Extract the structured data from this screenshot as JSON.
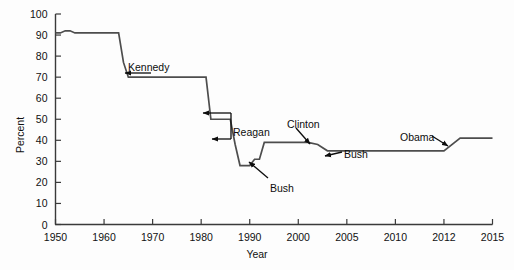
{
  "chart_data": {
    "type": "line",
    "title": "",
    "xlabel": "Year",
    "ylabel": "Percent",
    "ylim": [
      0,
      100
    ],
    "grid": false,
    "legend": "none",
    "y_ticks": [
      0,
      10,
      20,
      30,
      40,
      50,
      60,
      70,
      80,
      90,
      100
    ],
    "x_ticks": [
      1950,
      1960,
      1970,
      1980,
      1990,
      2000,
      2005,
      2010,
      2012,
      2015
    ],
    "x_tick_labels": [
      "1950",
      "1960",
      "1970",
      "1980",
      "1990",
      "2000",
      "2005",
      "2010",
      "2012",
      "2015"
    ],
    "y_tick_labels": [
      "0",
      "10",
      "20",
      "30",
      "40",
      "50",
      "60",
      "70",
      "80",
      "90",
      "100"
    ],
    "series": [
      {
        "name": "Top marginal tax rate",
        "color": "#4d4d4d",
        "x": [
          1950,
          1951,
          1952,
          1953,
          1954,
          1963,
          1964,
          1965,
          1981,
          1982,
          1986,
          1987,
          1988,
          1990,
          1991,
          1992,
          1993,
          1994,
          2001,
          2002,
          2003,
          2012,
          2013,
          2015
        ],
        "y": [
          91,
          91,
          92,
          92,
          91,
          91,
          77,
          70,
          70,
          50,
          50,
          38,
          28,
          28,
          31,
          31,
          39,
          39,
          39,
          38,
          35,
          35,
          41,
          41
        ]
      }
    ],
    "annotations": [
      {
        "name": "kennedy",
        "text": "Kennedy",
        "label_x": 128,
        "label_y": 61,
        "arrow": {
          "x1": 151,
          "y1": 73,
          "x2": 125,
          "y2": 73
        }
      },
      {
        "name": "reagan",
        "text": "Reagan",
        "label_x": 233,
        "label_y": 126,
        "arrow_upper": {
          "x1": 231,
          "y1": 113,
          "x2": 203,
          "y2": 113
        },
        "arrow_lower": {
          "x1": 231,
          "y1": 139,
          "x2": 212,
          "y2": 139
        }
      },
      {
        "name": "clinton",
        "text": "Clinton",
        "label_x": 287,
        "label_y": 118,
        "arrow": {
          "x1": 296,
          "y1": 128,
          "x2": 310,
          "y2": 144
        }
      },
      {
        "name": "bush-41",
        "text": "Bush",
        "label_x": 270,
        "label_y": 182,
        "arrow": {
          "x1": 268,
          "y1": 178,
          "x2": 249,
          "y2": 162
        }
      },
      {
        "name": "bush-43",
        "text": "Bush",
        "label_x": 344,
        "label_y": 148,
        "arrow": {
          "x1": 342,
          "y1": 152,
          "x2": 325,
          "y2": 156
        }
      },
      {
        "name": "obama",
        "text": "Obama",
        "label_x": 400,
        "label_y": 131,
        "arrow": {
          "x1": 432,
          "y1": 136,
          "x2": 448,
          "y2": 146
        }
      }
    ]
  },
  "axes": {
    "x_axis_name": "year-axis",
    "y_axis_name": "percent-axis"
  }
}
